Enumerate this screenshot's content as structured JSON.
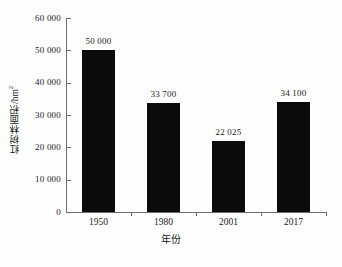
{
  "chart_data": {
    "type": "bar",
    "title": "",
    "subtitle": "",
    "categories": [
      "1950",
      "1980",
      "2001",
      "2017"
    ],
    "values": [
      50000,
      33700,
      22025,
      34100
    ],
    "data_labels": [
      "50 000",
      "33 700",
      "22 025",
      "34 100"
    ],
    "xlabel": "年份",
    "ylabel": "红树林面积/hm",
    "ylabel_superscript": "2",
    "ylim": [
      0,
      60000
    ],
    "ytick_values": [
      0,
      10000,
      20000,
      30000,
      40000,
      50000,
      60000
    ],
    "ytick_labels": [
      "0",
      "10 000",
      "20 000",
      "30 000",
      "40 000",
      "50 000",
      "60 000"
    ],
    "grid": false,
    "legend": null,
    "bar_color": "#0b0b0b",
    "axis_color": "#6e6e6e",
    "background_color": "#ffffff"
  }
}
